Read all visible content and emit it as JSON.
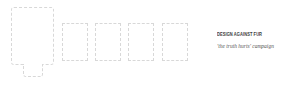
{
  "project": {
    "title": "DESIGN AGAINST FUR",
    "subtitle": "'the truth hurts' campaign"
  },
  "frames": {
    "main": {
      "shape": "poster-with-tab",
      "label": ""
    },
    "thumbnails": [
      {
        "index": 1
      },
      {
        "index": 2
      },
      {
        "index": 3
      },
      {
        "index": 4
      }
    ]
  },
  "colors": {
    "background": "#ffffff",
    "frame_border": "#d8d8d8",
    "title_text": "#3a3a3a",
    "subtitle_text": "#555555"
  }
}
